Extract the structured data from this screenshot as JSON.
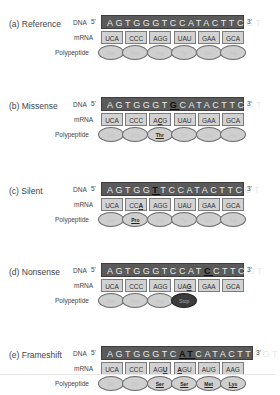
{
  "labels": {
    "dna": "DNA",
    "five_prime": "5'",
    "three_prime": "3'",
    "mrna": "mRNA",
    "polypeptide": "Polypeptide"
  },
  "colors": {
    "dna_bar": "#5a5a5a",
    "codon_box": "#d2d2d2",
    "amino_acid": "#cfcfcf",
    "stop_codon": "#3b3b3b"
  },
  "panels": [
    {
      "title": "(a) Reference",
      "dna": {
        "before": "AGTGGGTCCATACTTCGT",
        "mutation": "",
        "after": ""
      },
      "codons": [
        {
          "text": "UCA",
          "mut_pos": -1
        },
        {
          "text": "CCC",
          "mut_pos": -1
        },
        {
          "text": "AGG",
          "mut_pos": -1
        },
        {
          "text": "UAU",
          "mut_pos": -1
        },
        {
          "text": "GAA",
          "mut_pos": -1
        },
        {
          "text": "GCA",
          "mut_pos": -1
        }
      ],
      "amino_acids": [
        {
          "name": "Ser",
          "state": "normal"
        },
        {
          "name": "Pro",
          "state": "normal"
        },
        {
          "name": "Arg",
          "state": "normal"
        },
        {
          "name": "Tyr",
          "state": "normal"
        },
        {
          "name": "Glu",
          "state": "normal"
        },
        {
          "name": "Ala",
          "state": "normal"
        }
      ]
    },
    {
      "title": "(b) Missense",
      "dna": {
        "before": "AGTGGGT",
        "mutation": "G",
        "after": "CATACTTCGT"
      },
      "codons": [
        {
          "text": "UCA",
          "mut_pos": -1
        },
        {
          "text": "CCC",
          "mut_pos": -1
        },
        {
          "text": "ACG",
          "mut_pos": 1
        },
        {
          "text": "UAU",
          "mut_pos": -1
        },
        {
          "text": "GAA",
          "mut_pos": -1
        },
        {
          "text": "GCA",
          "mut_pos": -1
        }
      ],
      "amino_acids": [
        {
          "name": "Ser",
          "state": "normal"
        },
        {
          "name": "Pro",
          "state": "normal"
        },
        {
          "name": "Thr",
          "state": "changed"
        },
        {
          "name": "Tyr",
          "state": "normal"
        },
        {
          "name": "Glu",
          "state": "normal"
        },
        {
          "name": "Ala",
          "state": "normal"
        }
      ]
    },
    {
      "title": "(c) Silent",
      "dna": {
        "before": "AGTGG",
        "mutation": "T",
        "after": "TCCATACTTCGT"
      },
      "codons": [
        {
          "text": "UCA",
          "mut_pos": -1
        },
        {
          "text": "CCA",
          "mut_pos": 2
        },
        {
          "text": "AGG",
          "mut_pos": -1
        },
        {
          "text": "UAU",
          "mut_pos": -1
        },
        {
          "text": "GAA",
          "mut_pos": -1
        },
        {
          "text": "GCA",
          "mut_pos": -1
        }
      ],
      "amino_acids": [
        {
          "name": "Ser",
          "state": "normal"
        },
        {
          "name": "Pro",
          "state": "changed"
        },
        {
          "name": "Arg",
          "state": "normal"
        },
        {
          "name": "Tyr",
          "state": "normal"
        },
        {
          "name": "Glu",
          "state": "normal"
        },
        {
          "name": "Ala",
          "state": "normal"
        }
      ]
    },
    {
      "title": "(d) Nonsense",
      "dna": {
        "before": "AGTGGGTCCAT",
        "mutation": "C",
        "after": "CTTCGT"
      },
      "codons": [
        {
          "text": "UCA",
          "mut_pos": -1
        },
        {
          "text": "CCC",
          "mut_pos": -1
        },
        {
          "text": "AGG",
          "mut_pos": -1
        },
        {
          "text": "UAG",
          "mut_pos": 2
        },
        {
          "text": "GAA",
          "mut_pos": -1
        },
        {
          "text": "GCA",
          "mut_pos": -1
        }
      ],
      "amino_acids": [
        {
          "name": "Ser",
          "state": "normal"
        },
        {
          "name": "Pro",
          "state": "normal"
        },
        {
          "name": "Arg",
          "state": "normal"
        },
        {
          "name": "Stop",
          "state": "stop"
        }
      ]
    },
    {
      "title": "(e) Frameshift",
      "dna": {
        "before": "AGTGGGTC",
        "mutation": "AT",
        "after": "CATACTTCGT"
      },
      "codons": [
        {
          "text": "UCA",
          "mut_pos": -1
        },
        {
          "text": "CCC",
          "mut_pos": -1
        },
        {
          "text": "AGU",
          "mut_pos": 2
        },
        {
          "text": "AGU",
          "mut_pos": 0
        },
        {
          "text": "AUG",
          "mut_pos": -1
        },
        {
          "text": "AAG",
          "mut_pos": -1
        }
      ],
      "amino_acids": [
        {
          "name": "Ser",
          "state": "normal"
        },
        {
          "name": "Pro",
          "state": "normal"
        },
        {
          "name": "Ser",
          "state": "changed"
        },
        {
          "name": "Ser",
          "state": "changed"
        },
        {
          "name": "Met",
          "state": "changed"
        },
        {
          "name": "Lys",
          "state": "changed"
        }
      ]
    }
  ]
}
